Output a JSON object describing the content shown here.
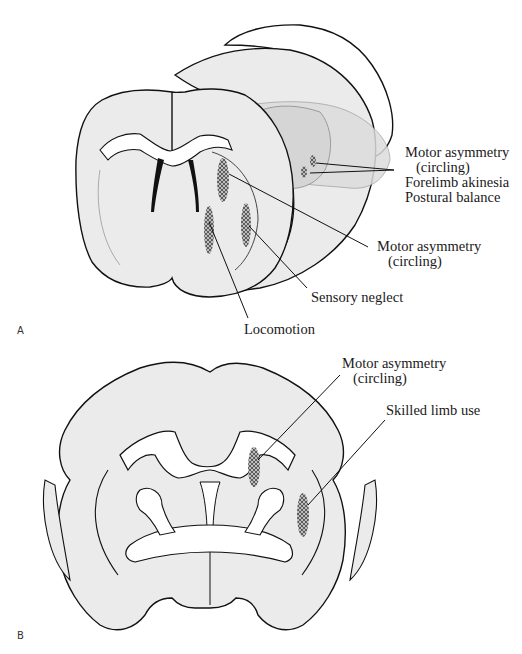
{
  "figure": {
    "panels": [
      {
        "id": "A",
        "label": "A",
        "view": "oblique 3D coronal brain section",
        "annotations": [
          {
            "line1": "Motor asymmetry",
            "line2": "(circling)",
            "line3": "Forelimb akinesia",
            "line4": "Postural balance"
          },
          {
            "line1": "Motor asymmetry",
            "line2": "(circling)"
          },
          {
            "line1": "Sensory neglect"
          },
          {
            "line1": "Locomotion"
          }
        ]
      },
      {
        "id": "B",
        "label": "B",
        "view": "coronal brain section",
        "annotations": [
          {
            "line1": "Motor asymmetry",
            "line2": "(circling)"
          },
          {
            "line1": "Skilled limb use"
          }
        ]
      }
    ],
    "colors": {
      "tissue_fill": "#ebebeb",
      "tissue_fill_dark": "#dcdcdc",
      "outline": "#111111",
      "lesion": "#555555",
      "background": "#ffffff"
    }
  }
}
